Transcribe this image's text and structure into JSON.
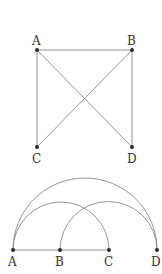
{
  "graph1": {
    "title": "",
    "nodes": [
      {
        "id": "A",
        "label": "A",
        "x": 37,
        "y": 50,
        "lx": 32,
        "ly": 45
      },
      {
        "id": "B",
        "label": "B",
        "x": 132,
        "y": 50,
        "lx": 127,
        "ly": 45
      },
      {
        "id": "C",
        "label": "C",
        "x": 37,
        "y": 147,
        "lx": 32,
        "ly": 163
      },
      {
        "id": "D",
        "label": "D",
        "x": 132,
        "y": 147,
        "lx": 127,
        "ly": 163
      }
    ],
    "edges": [
      [
        "A",
        "B"
      ],
      [
        "A",
        "C"
      ],
      [
        "B",
        "D"
      ],
      [
        "A",
        "D"
      ],
      [
        "B",
        "C"
      ]
    ]
  },
  "graph2": {
    "nodes": [
      {
        "id": "A",
        "label": "A",
        "x": 13,
        "y": 250,
        "lx": 8,
        "ly": 266
      },
      {
        "id": "B",
        "label": "B",
        "x": 60,
        "y": 250,
        "lx": 55,
        "ly": 266
      },
      {
        "id": "C",
        "label": "C",
        "x": 109,
        "y": 250,
        "lx": 104,
        "ly": 266
      },
      {
        "id": "D",
        "label": "D",
        "x": 157,
        "y": 250,
        "lx": 151,
        "ly": 266
      }
    ],
    "line": [
      "A",
      "C"
    ],
    "arcs": [
      [
        "A",
        "D"
      ],
      [
        "A",
        "C"
      ],
      [
        "B",
        "D"
      ]
    ]
  },
  "colors": {
    "edge": "#8a8a8a",
    "point": "#2a2a2a",
    "label": "#333333"
  }
}
